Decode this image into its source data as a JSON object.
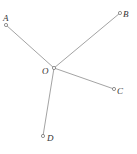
{
  "diagram": {
    "points": {
      "O": {
        "label": "O",
        "x": 54,
        "y": 68,
        "lx": 42,
        "ly": 74
      },
      "A": {
        "label": "A",
        "x": 6,
        "y": 25,
        "lx": 3,
        "ly": 21
      },
      "B": {
        "label": "B",
        "x": 120,
        "y": 13,
        "lx": 123,
        "ly": 17
      },
      "C": {
        "label": "C",
        "x": 114,
        "y": 89,
        "lx": 117,
        "ly": 94
      },
      "D": {
        "label": "D",
        "x": 43,
        "y": 136,
        "lx": 47,
        "ly": 141
      }
    },
    "segments": [
      "OA",
      "OB",
      "OC",
      "OD"
    ],
    "line_color": "#999999",
    "point_color": "#666666"
  }
}
